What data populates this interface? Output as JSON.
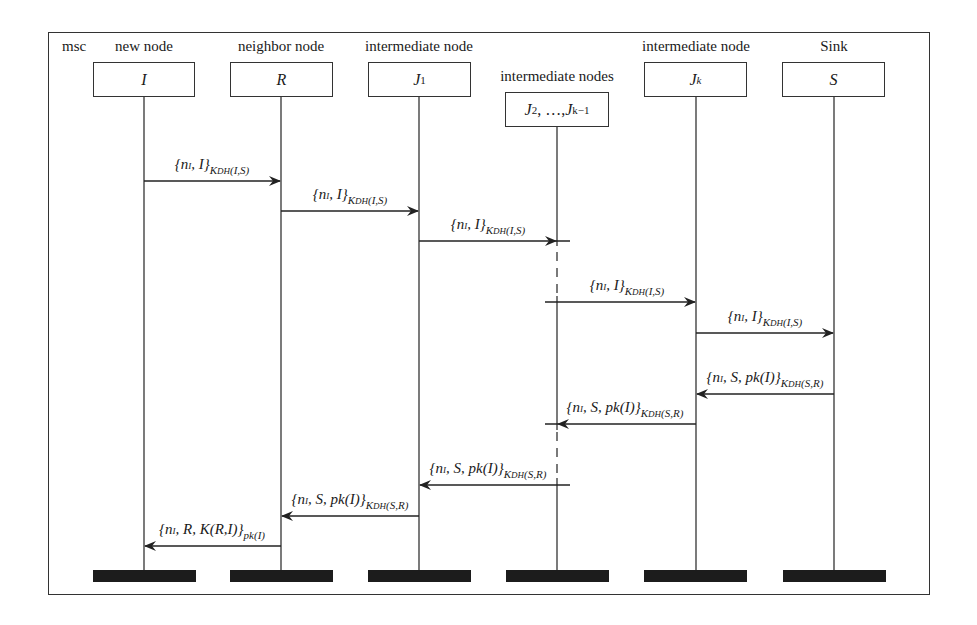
{
  "diagram": {
    "frame_label": "msc",
    "lifelines": [
      {
        "role": "new node",
        "name": "I",
        "x": 144
      },
      {
        "role": "neighbor node",
        "name": "R",
        "x": 281
      },
      {
        "role": "intermediate node",
        "name": "J1",
        "x": 419
      },
      {
        "role": "intermediate nodes",
        "name": "J2, ..., Jk-1",
        "x": 557
      },
      {
        "role": "intermediate node",
        "name": "Jk",
        "x": 696
      },
      {
        "role": "Sink",
        "name": "S",
        "x": 834
      }
    ],
    "messages": [
      {
        "from": "I",
        "to": "R",
        "label": "{nI, I}KDH(I,S)",
        "y": 181
      },
      {
        "from": "R",
        "to": "J1",
        "label": "{nI, I}KDH(I,S)",
        "y": 211
      },
      {
        "from": "J1",
        "to": "J2..Jk-1",
        "label": "{nI, I}KDH(I,S)",
        "y": 241
      },
      {
        "from": "J2..Jk-1",
        "to": "Jk",
        "label": "{nI, I}KDH(I,S)",
        "y": 302
      },
      {
        "from": "Jk",
        "to": "S",
        "label": "{nI, I}KDH(I,S)",
        "y": 333
      },
      {
        "from": "S",
        "to": "Jk",
        "label": "{nI, S, pk(I)}KDH(S,R)",
        "y": 394
      },
      {
        "from": "Jk",
        "to": "J2..Jk-1",
        "label": "{nI, S, pk(I)}KDH(S,R)",
        "y": 424
      },
      {
        "from": "J2..Jk-1",
        "to": "J1",
        "label": "{nI, S, pk(I)}KDH(S,R)",
        "y": 485
      },
      {
        "from": "J1",
        "to": "R",
        "label": "{nI, S, pk(I)}KDH(S,R)",
        "y": 516
      },
      {
        "from": "R",
        "to": "I",
        "label": "{nI, R, K(R,I)}pk(I)",
        "y": 546
      }
    ]
  },
  "labels": {
    "msc": "msc",
    "role_I": "new node",
    "role_R": "neighbor node",
    "role_J1": "intermediate node",
    "role_J2": "intermediate nodes",
    "role_Jk": "intermediate node",
    "role_S": "Sink",
    "name_I": "I",
    "name_R": "R",
    "name_J": "J",
    "sub_1": "1",
    "name_J2": "J",
    "sub_2": "2",
    "sep": ", …, ",
    "sub_km1": "k−1",
    "sub_k": "k",
    "name_S": "S",
    "msg_fwd_main": "{n",
    "msg_fwd_tail": ", I}",
    "msg_sub_I": "I",
    "msg_fwd_key": "K",
    "msg_key_sub": "DH",
    "msg_fwd_args": "(I,S)",
    "msg_back_tail": ", S, pk(I)}",
    "msg_back_args": "(S,R)",
    "msg_last_tail": ", R, K(R,I)}",
    "msg_last_key": "pk(I)"
  }
}
